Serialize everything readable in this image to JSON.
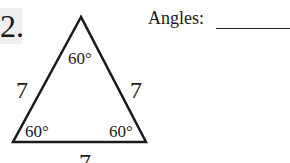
{
  "problem": {
    "number": "2.",
    "prompt": "Angles:",
    "answer_blank": ""
  },
  "triangle": {
    "type": "equilateral",
    "sides": {
      "left": "7",
      "right": "7",
      "bottom": "7"
    },
    "angles": {
      "top": "60°",
      "bottom_left": "60°",
      "bottom_right": "60°"
    }
  }
}
